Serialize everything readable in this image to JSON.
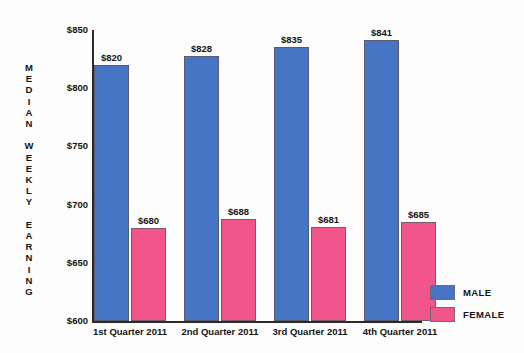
{
  "chart_data": {
    "type": "bar",
    "title": "",
    "xlabel": "",
    "ylabel": "MEDIAN WEEKLY EARNING",
    "ylim": [
      600,
      850
    ],
    "ytick_step": 50,
    "ytick_labels": [
      "$850",
      "$800",
      "$750",
      "$700",
      "$650",
      "$600"
    ],
    "ytick_values": [
      850,
      800,
      750,
      700,
      650,
      600
    ],
    "grid": false,
    "legend_position": "bottom-right",
    "categories": [
      "1st Quarter 2011",
      "2nd Quarter 2011",
      "3rd Quarter 2011",
      "4th Quarter 2011"
    ],
    "series": [
      {
        "name": "MALE",
        "color": "#4575C4",
        "values": [
          820,
          828,
          835,
          841
        ],
        "labels": [
          "$820",
          "$828",
          "$835",
          "$841"
        ]
      },
      {
        "name": "FEMALE",
        "color": "#F1558C",
        "values": [
          680,
          688,
          681,
          685
        ],
        "labels": [
          "$680",
          "$688",
          "$681",
          "$685"
        ]
      }
    ]
  },
  "axis": {
    "y_title_stacked": "M\nE\nD\nI\nA\nN\n\nW\nE\nE\nK\nL\nY\n\nE\nA\nR\nN\nI\nN\nG"
  },
  "legend": {
    "items": [
      {
        "label": "MALE",
        "color": "#4575C4"
      },
      {
        "label": "FEMALE",
        "color": "#F1558C"
      }
    ]
  }
}
